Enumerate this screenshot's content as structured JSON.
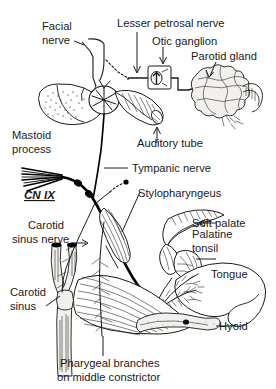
{
  "figure": {
    "width": 276,
    "height": 389,
    "background": "#ffffff",
    "ink_color": "#1a1a1a"
  },
  "labels": {
    "facial_nerve_l1": "Facial",
    "facial_nerve_l2": "nerve",
    "lesser_petrosal_nerve": "Lesser petrosal nerve",
    "otic_ganglion": "Otic ganglion",
    "parotid_gland": "Parotid gland",
    "mastoid_l1": "Mastoid",
    "mastoid_l2": "process",
    "cn_ix": "CN IX",
    "auditory_tube": "Auditory tube",
    "tympanic_nerve": "Tympanic nerve",
    "stylopharyngeus": "Stylopharyngeus",
    "soft_palate": "Soft palate",
    "palatine_tonsil_l1": "Palatine",
    "palatine_tonsil_l2": "tonsil",
    "tongue": "Tongue",
    "carotid_sinus_nerve_l1": "Carotid",
    "carotid_sinus_nerve_l2": "sinus nerve",
    "carotid_sinus_l1": "Carotid",
    "carotid_sinus_l2": "sinus",
    "hyoid": "Hyoid",
    "pharyngeal_branches_l1": "Pharygeal branches",
    "pharyngeal_branches_l2": "on middle constrictor"
  },
  "structures": [
    {
      "name": "facial-nerve",
      "label": "Facial nerve"
    },
    {
      "name": "lesser-petrosal-nerve",
      "label": "Lesser petrosal nerve"
    },
    {
      "name": "otic-ganglion",
      "label": "Otic ganglion"
    },
    {
      "name": "parotid-gland",
      "label": "Parotid gland"
    },
    {
      "name": "mastoid-process",
      "label": "Mastoid process"
    },
    {
      "name": "glossopharyngeal-nerve",
      "label": "CN IX"
    },
    {
      "name": "auditory-tube",
      "label": "Auditory tube"
    },
    {
      "name": "tympanic-nerve",
      "label": "Tympanic nerve"
    },
    {
      "name": "stylopharyngeus-muscle",
      "label": "Stylopharyngeus"
    },
    {
      "name": "soft-palate",
      "label": "Soft palate"
    },
    {
      "name": "palatine-tonsil",
      "label": "Palatine tonsil"
    },
    {
      "name": "tongue",
      "label": "Tongue"
    },
    {
      "name": "carotid-sinus-nerve",
      "label": "Carotid sinus nerve"
    },
    {
      "name": "carotid-sinus",
      "label": "Carotid sinus"
    },
    {
      "name": "hyoid-bone",
      "label": "Hyoid"
    },
    {
      "name": "pharyngeal-branches",
      "label": "Pharygeal branches on middle constrictor"
    }
  ]
}
